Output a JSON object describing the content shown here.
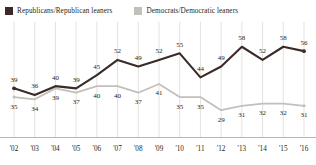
{
  "chart_data": {
    "type": "line",
    "title": "",
    "subtitle": "",
    "xlabel": "",
    "ylabel": "",
    "grid": true,
    "grid_orientation": "vertical",
    "legend_position": "top-left",
    "ylim": [
      25,
      62
    ],
    "categories": [
      "'02",
      "'03",
      "'04",
      "'05",
      "'06",
      "'07",
      "'08",
      "'09",
      "'10",
      "'11",
      "'12",
      "'13",
      "'14",
      "'15",
      "'16"
    ],
    "series": [
      {
        "name": "Republicans/Republican leaners",
        "color": "#3b2b28",
        "values": [
          39,
          36,
          40,
          39,
          45,
          52,
          49,
          52,
          55,
          44,
          49,
          58,
          52,
          58,
          56
        ]
      },
      {
        "name": "Democrats/Democratic leaners",
        "color": "#c3c0bb",
        "values": [
          35,
          34,
          39,
          37,
          40,
          40,
          37,
          41,
          35,
          35,
          29,
          31,
          32,
          32,
          31
        ]
      }
    ]
  },
  "legend": {
    "items": [
      {
        "label": "Republicans/Republican leaners",
        "color": "#3b2b28"
      },
      {
        "label": "Democrats/Democratic leaners",
        "color": "#c3c0bb"
      }
    ]
  },
  "colors": {
    "republican": "#3b2b28",
    "democrat": "#c3c0bb",
    "gridline": "#d8d5d0",
    "axis": "#b9b6b1",
    "text": "#231f20"
  }
}
